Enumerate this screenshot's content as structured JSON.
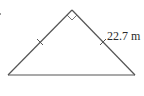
{
  "figure": {
    "type": "isosceles-right-triangle",
    "side_label": "22.7 m",
    "stroke_color": "#555555",
    "right_angle_marker": true,
    "congruent_leg_ticks": 2,
    "vertices": {
      "apex": [
        72,
        10
      ],
      "bottom_left": [
        8,
        75
      ],
      "bottom_right": [
        135,
        75
      ]
    }
  }
}
